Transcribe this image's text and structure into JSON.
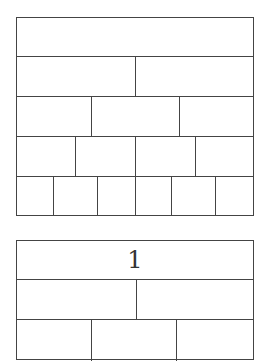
{
  "strips": [
    {
      "name": "top-fraction-strip",
      "top": 17,
      "height": 199,
      "rows": [
        {
          "top": 0,
          "height": 38,
          "cells": [
            {
              "x": 0,
              "w": 236,
              "label": ""
            }
          ]
        },
        {
          "top": 38,
          "height": 40,
          "cells": [
            {
              "x": 0,
              "w": 118,
              "label": ""
            },
            {
              "x": 118,
              "w": 118,
              "label": ""
            }
          ]
        },
        {
          "top": 78,
          "height": 40,
          "cells": [
            {
              "x": 0,
              "w": 74,
              "label": ""
            },
            {
              "x": 74,
              "w": 88,
              "label": ""
            },
            {
              "x": 162,
              "w": 74,
              "label": ""
            }
          ]
        },
        {
          "top": 118,
          "height": 40,
          "cells": [
            {
              "x": 0,
              "w": 58,
              "label": ""
            },
            {
              "x": 58,
              "w": 60,
              "label": ""
            },
            {
              "x": 118,
              "w": 60,
              "label": ""
            },
            {
              "x": 178,
              "w": 58,
              "label": ""
            }
          ]
        },
        {
          "top": 158,
          "height": 40,
          "cells": [
            {
              "x": 0,
              "w": 36,
              "label": ""
            },
            {
              "x": 36,
              "w": 44,
              "label": ""
            },
            {
              "x": 80,
              "w": 38,
              "label": ""
            },
            {
              "x": 118,
              "w": 36,
              "label": ""
            },
            {
              "x": 154,
              "w": 44,
              "label": ""
            },
            {
              "x": 198,
              "w": 38,
              "label": ""
            }
          ]
        }
      ]
    },
    {
      "name": "bottom-fraction-strip",
      "top": 240,
      "height": 120,
      "rows": [
        {
          "top": 0,
          "height": 38,
          "cells": [
            {
              "x": 0,
              "w": 236,
              "label": "1"
            }
          ]
        },
        {
          "top": 38,
          "height": 40,
          "cells": [
            {
              "x": 0,
              "w": 119,
              "label": ""
            },
            {
              "x": 119,
              "w": 117,
              "label": ""
            }
          ]
        },
        {
          "top": 78,
          "height": 42,
          "cells": [
            {
              "x": 0,
              "w": 74,
              "label": ""
            },
            {
              "x": 74,
              "w": 85,
              "label": ""
            },
            {
              "x": 159,
              "w": 77,
              "label": ""
            }
          ]
        }
      ]
    }
  ]
}
